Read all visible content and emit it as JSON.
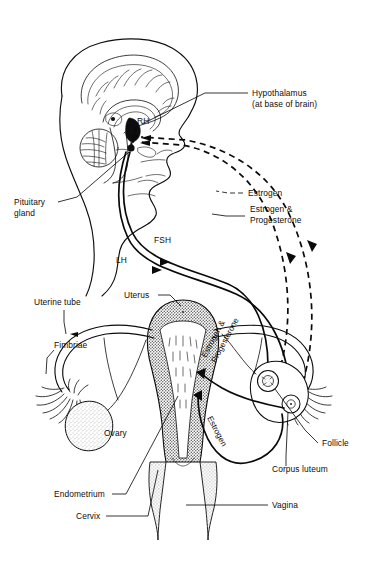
{
  "figure": {
    "type": "anatomical-flow-diagram",
    "background_color": "#ffffff",
    "line_color": "#0d0d0d"
  },
  "labels": {
    "hypothalamus": {
      "line1": "Hypothalamus",
      "line2": "(at base of brain)"
    },
    "rh": "RH",
    "pituitary": {
      "line1": "Pituitary",
      "line2": "gland"
    },
    "fsh": "FSH",
    "lh": "LH",
    "estrogen_feedback": "Estrogen",
    "estrogen_progesterone_feedback": {
      "line1": "Estrogen &",
      "line2": "Progesterone"
    },
    "uterine_tube": "Uterine tube",
    "fimbriae": "Fimbriae",
    "uterus": "Uterus",
    "ovary": "Ovary",
    "endometrium": "Endometrium",
    "cervix": "Cervix",
    "vagina": "Vagina",
    "follicle": "Follicle",
    "corpus_luteum": "Corpus luteum",
    "estrogen_progesterone_uterus": {
      "line1": "Estrogen &",
      "line2": "Progesterone"
    },
    "estrogen_uterus": "Estrogen"
  },
  "flows": [
    {
      "name": "RH",
      "from": "hypothalamus",
      "to": "pituitary",
      "style": "solid-short-arrow"
    },
    {
      "name": "FSH",
      "from": "pituitary",
      "to": "ovary-follicle",
      "style": "solid"
    },
    {
      "name": "LH",
      "from": "pituitary",
      "to": "ovary-corpus-luteum",
      "style": "solid"
    },
    {
      "name": "Estrogen",
      "from": "ovary-follicle",
      "to": "hypothalamus",
      "style": "dashed"
    },
    {
      "name": "Estrogen & Progesterone",
      "from": "corpus-luteum",
      "to": "hypothalamus",
      "style": "dashed"
    },
    {
      "name": "Estrogen & Progesterone",
      "from": "corpus-luteum",
      "to": "endometrium",
      "style": "solid"
    },
    {
      "name": "Estrogen",
      "from": "ovary-follicle",
      "to": "endometrium",
      "style": "solid"
    }
  ]
}
